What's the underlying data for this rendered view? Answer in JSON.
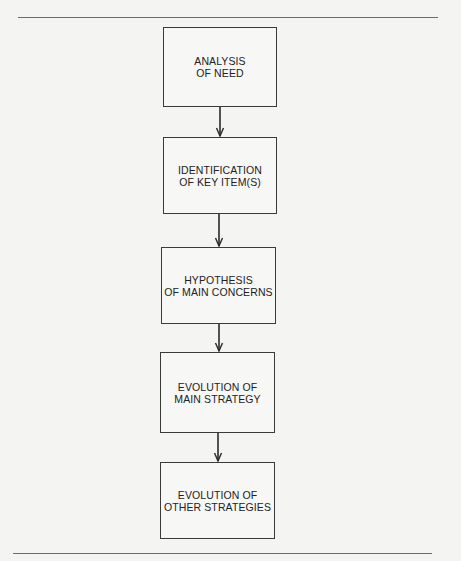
{
  "diagram": {
    "type": "flowchart",
    "direction": "top-to-bottom",
    "nodes": [
      {
        "id": "n1",
        "lines": [
          "ANALYSIS",
          "OF NEED"
        ]
      },
      {
        "id": "n2",
        "lines": [
          "IDENTIFICATION",
          "OF KEY ITEM(S)"
        ]
      },
      {
        "id": "n3",
        "lines": [
          "HYPOTHESIS",
          "OF MAIN CONCERNS"
        ]
      },
      {
        "id": "n4",
        "lines": [
          "EVOLUTION OF",
          "MAIN STRATEGY"
        ]
      },
      {
        "id": "n5",
        "lines": [
          "EVOLUTION OF",
          "OTHER STRATEGIES"
        ]
      }
    ],
    "edges": [
      {
        "from": "n1",
        "to": "n2"
      },
      {
        "from": "n2",
        "to": "n3"
      },
      {
        "from": "n3",
        "to": "n4"
      },
      {
        "from": "n4",
        "to": "n5"
      }
    ]
  },
  "colors": {
    "background": "#f4f4f2",
    "stroke": "#3a3a3a",
    "rule": "#6a6a6a",
    "text": "#222222"
  }
}
